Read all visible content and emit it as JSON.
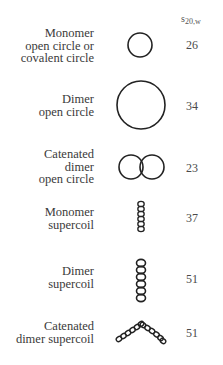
{
  "column_header": {
    "symbol": "s",
    "subscript": "20,w"
  },
  "rows": [
    {
      "label_lines": [
        "Monomer",
        "open circle or",
        "covalent circle"
      ],
      "value": "26",
      "shape": "single-circle-small-icon"
    },
    {
      "label_lines": [
        "Dimer",
        "open circle"
      ],
      "value": "34",
      "shape": "single-circle-large-icon"
    },
    {
      "label_lines": [
        "Catenated",
        "dimer",
        "open circle"
      ],
      "value": "23",
      "shape": "interlocked-circles-icon"
    },
    {
      "label_lines": [
        "Monomer",
        "supercoil"
      ],
      "value": "37",
      "shape": "short-supercoil-icon"
    },
    {
      "label_lines": [
        "Dimer",
        "supercoil"
      ],
      "value": "51",
      "shape": "long-supercoil-icon"
    },
    {
      "label_lines": [
        "Catenated",
        "dimer supercoil"
      ],
      "value": "51",
      "shape": "catenated-supercoil-icon"
    }
  ],
  "colors": {
    "stroke": "#222222",
    "text": "#3a3a3a"
  }
}
